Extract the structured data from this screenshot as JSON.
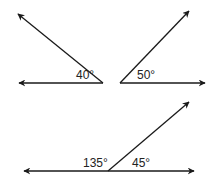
{
  "diagram": {
    "title": "",
    "figures": [
      {
        "id": "angle-40",
        "type": "angle",
        "vertex": [
          103,
          83
        ],
        "rays": [
          [
            16,
            13
          ],
          [
            18,
            83
          ]
        ],
        "label": "40°",
        "label_pos": [
          76,
          79
        ]
      },
      {
        "id": "angle-50",
        "type": "angle",
        "vertex": [
          120,
          83
        ],
        "rays": [
          [
            190,
            10
          ],
          [
            206,
            83
          ]
        ],
        "label": "50°",
        "label_pos": [
          137,
          79
        ]
      },
      {
        "id": "linear-pair",
        "type": "linear-pair",
        "vertex": [
          108,
          171
        ],
        "rays": [
          [
            23,
            171
          ],
          [
            195,
            171
          ],
          [
            190,
            101
          ]
        ],
        "labels": [
          {
            "text": "135°",
            "pos": [
              83,
              167
            ]
          },
          {
            "text": "45°",
            "pos": [
              132,
              167
            ]
          }
        ]
      }
    ],
    "colors": {
      "stroke": "#1a1a1a",
      "text": "#222222",
      "background": "#ffffff"
    }
  }
}
